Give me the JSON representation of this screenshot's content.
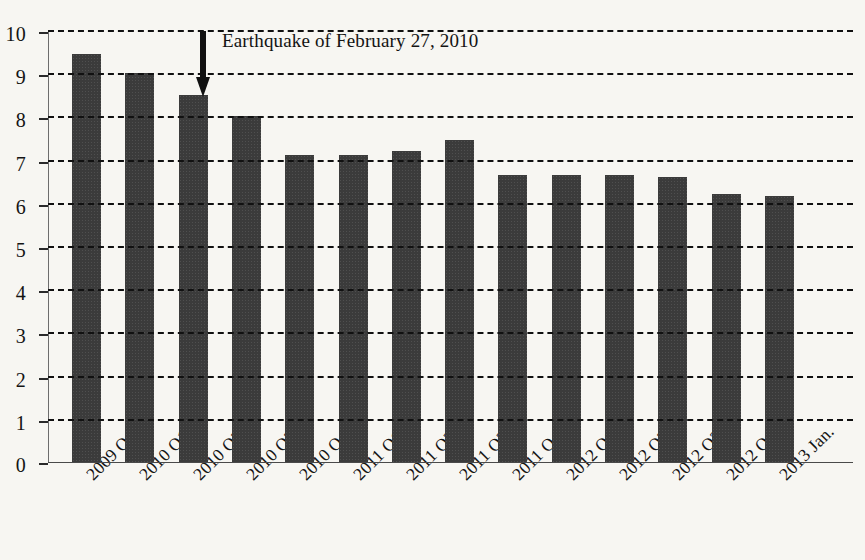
{
  "chart_data": {
    "type": "bar",
    "title": "",
    "subtitle": "",
    "xlabel": "",
    "ylabel": "",
    "ylim": [
      0,
      10
    ],
    "ytick_labels": [
      "0",
      "1",
      "2",
      "3",
      "4",
      "5",
      "6",
      "7",
      "8",
      "9",
      "10"
    ],
    "ytick_values": [
      0,
      1,
      2,
      3,
      4,
      5,
      6,
      7,
      8,
      9,
      10
    ],
    "grid": true,
    "grid_style": "dashed",
    "grid_axis": "y",
    "legend": "none",
    "bar_color": "#3b3b3b",
    "background_color": "#f7f6f2",
    "categories": [
      "2009 Q4",
      "2010 Q1",
      "2010 Q2",
      "2010 Q3",
      "2010 Q4",
      "2011 Q1",
      "2011 Q2",
      "2011 Q3",
      "2011 Q4",
      "2012 Q1",
      "2012 Q2",
      "2012 Q3",
      "2012 Q4",
      "2013 Jan."
    ],
    "values": [
      9.45,
      9.0,
      8.5,
      8.0,
      7.1,
      7.1,
      7.2,
      7.45,
      6.65,
      6.65,
      6.65,
      6.6,
      6.2,
      6.15
    ],
    "annotations": [
      {
        "text": "Earthquake of February 27, 2010",
        "marker": "down-arrow",
        "points_at_category": "2010 Q2"
      }
    ]
  }
}
